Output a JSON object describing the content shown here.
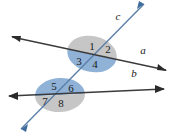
{
  "figure": {
    "type": "geometry-diagram",
    "background_color": "#ffffff"
  },
  "colors": {
    "gray_fill": "#c6c6c6",
    "blue_fill": "#8fb2d6",
    "line_a_color": "#3b3b3b",
    "line_b_color": "#3b3b3b",
    "line_c_color": "#5a7fa8",
    "text_color": "#1a1a1a"
  },
  "lines": [
    {
      "id": "line-a",
      "label": "a",
      "label_x": 143,
      "label_y": 51,
      "x1": 12,
      "y1": 37,
      "x2": 166,
      "y2": 70,
      "color": "#3b3b3b",
      "arrow_start": true,
      "arrow_end": true
    },
    {
      "id": "line-b",
      "label": "b",
      "label_x": 134,
      "label_y": 74,
      "x1": 9,
      "y1": 96,
      "x2": 164,
      "y2": 89,
      "color": "#3b3b3b",
      "arrow_start": true,
      "arrow_end": true
    },
    {
      "id": "line-c",
      "label": "c",
      "label_x": 118,
      "label_y": 17,
      "x1": 21,
      "y1": 129,
      "x2": 144,
      "y2": 4,
      "color": "#5a7fa8",
      "arrow_start": true,
      "arrow_end": true
    }
  ],
  "intersections": [
    {
      "id": "upper-intersection",
      "center_x": 92,
      "center_y": 54,
      "radius_x": 25,
      "radius_y": 18,
      "top_half_color": "#c6c6c6",
      "bottom_half_color": "#8fb2d6",
      "split_angle_deg": 12
    },
    {
      "id": "lower-intersection",
      "center_x": 60,
      "center_y": 95,
      "radius_x": 25,
      "radius_y": 17,
      "top_half_color": "#8fb2d6",
      "bottom_half_color": "#c6c6c6",
      "split_angle_deg": -3
    }
  ],
  "angles": [
    {
      "label": "1",
      "x": 92,
      "y": 47,
      "region": "upper-above-left"
    },
    {
      "label": "2",
      "x": 108,
      "y": 50,
      "region": "upper-above-right"
    },
    {
      "label": "3",
      "x": 79,
      "y": 62,
      "region": "upper-below-left"
    },
    {
      "label": "4",
      "x": 95,
      "y": 65,
      "region": "upper-below-right"
    },
    {
      "label": "5",
      "x": 54,
      "y": 87,
      "region": "lower-above-left"
    },
    {
      "label": "6",
      "x": 71,
      "y": 89,
      "region": "lower-above-right"
    },
    {
      "label": "7",
      "x": 45,
      "y": 102,
      "region": "lower-below-left"
    },
    {
      "label": "8",
      "x": 61,
      "y": 104,
      "region": "lower-below-right"
    }
  ]
}
